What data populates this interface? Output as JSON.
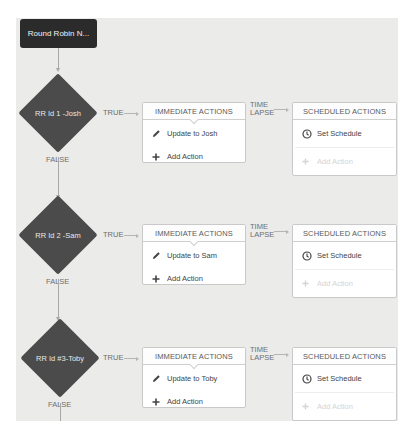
{
  "start_node": {
    "label": "Round Robin N..."
  },
  "rows": [
    {
      "criteria": "RR Id 1 -Josh",
      "true_label": "TRUE",
      "false_label": "FALSE",
      "immediate": {
        "title": "IMMEDIATE ACTIONS",
        "action": "Update to Josh",
        "add_label": "Add Action"
      },
      "time_lapse": [
        "TIME",
        "LAPSE"
      ],
      "scheduled": {
        "title": "SCHEDULED ACTIONS",
        "schedule_label": "Set Schedule",
        "add_label": "Add Action"
      }
    },
    {
      "criteria": "RR Id 2 -Sam",
      "true_label": "TRUE",
      "false_label": "FALSE",
      "immediate": {
        "title": "IMMEDIATE ACTIONS",
        "action": "Update to Sam",
        "add_label": "Add Action"
      },
      "time_lapse": [
        "TIME",
        "LAPSE"
      ],
      "scheduled": {
        "title": "SCHEDULED ACTIONS",
        "schedule_label": "Set Schedule",
        "add_label": "Add Action"
      }
    },
    {
      "criteria": "RR Id #3-Toby",
      "true_label": "TRUE",
      "false_label": "FALSE",
      "immediate": {
        "title": "IMMEDIATE ACTIONS",
        "action": "Update to Toby",
        "add_label": "Add Action"
      },
      "time_lapse": [
        "TIME",
        "LAPSE"
      ],
      "scheduled": {
        "title": "SCHEDULED ACTIONS",
        "schedule_label": "Set Schedule",
        "add_label": "Add Action"
      }
    }
  ],
  "icons": {
    "edit": "pencil-icon",
    "add": "plus-icon",
    "schedule": "clock-icon"
  },
  "colors": {
    "canvas": "#ebebea",
    "node_dark": "#2b2b2b",
    "diamond": "#4b4b4b",
    "box_border": "#c9c9c9",
    "connector": "#a8a8a8"
  }
}
